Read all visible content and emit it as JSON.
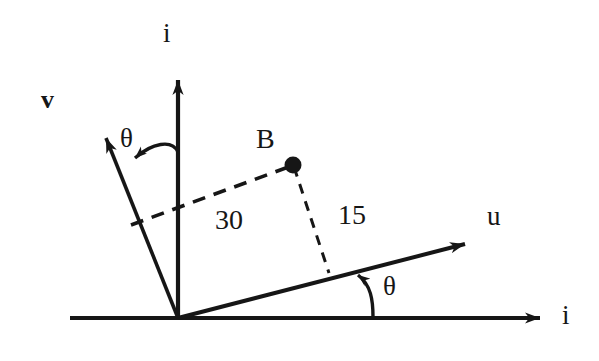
{
  "figure": {
    "type": "vector-geometry-diagram",
    "background_color": "#ffffff",
    "ink_color": "#161616"
  },
  "axes": {
    "vertical_i": {
      "label": "i",
      "origin": [
        178,
        318
      ],
      "tip": [
        178,
        75
      ]
    },
    "horizontal_i": {
      "label": "i",
      "start": [
        70,
        318
      ],
      "tip": [
        545,
        318
      ]
    },
    "u_axis": {
      "label": "u",
      "origin": [
        178,
        318
      ],
      "tip": [
        470,
        243
      ]
    },
    "v_axis": {
      "label": "v",
      "bold": true,
      "origin": [
        178,
        318
      ],
      "tip": [
        103,
        131
      ]
    }
  },
  "angles": {
    "upper": {
      "label": "θ",
      "from": "vertical-i-axis",
      "to": "v-axis"
    },
    "lower": {
      "label": "θ",
      "from": "horizontal-i-axis",
      "to": "u-axis"
    }
  },
  "point_b": {
    "label": "B",
    "position": [
      293,
      165
    ],
    "marker_radius": 8
  },
  "dimensions": [
    {
      "label": "30",
      "measures": "perpendicular distance from B to the v-axis",
      "from": [
        133,
        224
      ],
      "to": [
        293,
        165
      ],
      "style": "dashed"
    },
    {
      "label": "15",
      "measures": "perpendicular distance from B to the u-axis",
      "from": [
        293,
        165
      ],
      "to": [
        328,
        272
      ],
      "style": "dashed"
    }
  ]
}
